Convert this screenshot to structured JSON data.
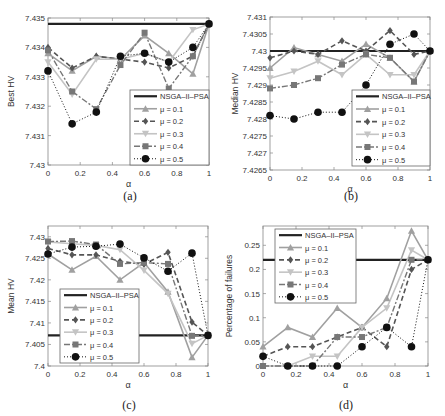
{
  "figure": {
    "captions": [
      "(a)",
      "(b)",
      "(c)",
      "(d)"
    ]
  },
  "styles": {
    "NSGA-II-PSA": {
      "color": "#222222",
      "width": 2.2,
      "dash": "",
      "marker": "none"
    },
    "μ = 0.1": {
      "color": "#a0a0a0",
      "width": 1.6,
      "dash": "",
      "marker": "triangle-up"
    },
    "μ = 0.2": {
      "color": "#555555",
      "width": 1.6,
      "dash": "5,3",
      "marker": "diamond"
    },
    "μ = 0.3": {
      "color": "#c4c4c4",
      "width": 1.6,
      "dash": "",
      "marker": "triangle-down"
    },
    "μ = 0.4": {
      "color": "#777777",
      "width": 1.4,
      "dash": "6,2,2,2",
      "marker": "square"
    },
    "μ = 0.5": {
      "color": "#111111",
      "width": 1.0,
      "dash": "1,2",
      "marker": "circle"
    }
  },
  "chart_data": [
    {
      "id": "a",
      "type": "line",
      "title": "",
      "caption": "(a)",
      "xlabel": "α",
      "ylabel": "Best HV",
      "xlim": [
        0,
        1
      ],
      "ylim": [
        7.43,
        7.435
      ],
      "xticks": [
        0,
        0.2,
        0.4,
        0.6,
        0.8,
        1
      ],
      "xtick_labels": [
        "0",
        "0.2",
        "0.4",
        "0.6",
        "0.8",
        "1"
      ],
      "yticks": [
        7.43,
        7.431,
        7.432,
        7.433,
        7.434,
        7.435
      ],
      "ytick_labels": [
        "7.43",
        "7.431",
        "7.432",
        "7.433",
        "7.434",
        "7.435"
      ],
      "frame": {
        "left": 48,
        "top": 18,
        "right": 209,
        "bottom": 165
      },
      "legend": {
        "x": 130,
        "y": 90,
        "w": 79,
        "h": 75,
        "position": "lower right"
      },
      "x": [
        0,
        0.15,
        0.3,
        0.45,
        0.6,
        0.75,
        0.9,
        1.0
      ],
      "baseline": {
        "name": "NSGA-II-PSA",
        "value": 7.4348
      },
      "series": [
        {
          "name": "μ = 0.1",
          "values": [
            7.4338,
            7.4332,
            7.4337,
            7.4336,
            7.4344,
            7.4338,
            7.4331,
            7.4348
          ]
        },
        {
          "name": "μ = 0.2",
          "values": [
            7.434,
            7.4333,
            7.4337,
            7.4336,
            7.4335,
            7.4333,
            7.4337,
            7.4348
          ]
        },
        {
          "name": "μ = 0.3",
          "values": [
            7.4335,
            7.4324,
            7.4336,
            7.4336,
            7.4338,
            7.4335,
            7.4346,
            7.4348
          ]
        },
        {
          "name": "μ = 0.4",
          "values": [
            7.4339,
            7.4325,
            7.4319,
            7.4334,
            7.4345,
            7.4326,
            7.4337,
            7.4348
          ]
        },
        {
          "name": "μ = 0.5",
          "values": [
            7.4332,
            7.4314,
            7.4318,
            7.4337,
            7.4338,
            7.4335,
            7.434,
            7.4348
          ]
        }
      ]
    },
    {
      "id": "b",
      "type": "line",
      "title": "",
      "caption": "(b)",
      "xlabel": "α",
      "ylabel": "Median HV",
      "xlim": [
        0,
        1
      ],
      "ylim": [
        7.4265,
        7.431
      ],
      "xticks": [
        0,
        0.2,
        0.4,
        0.6,
        0.8,
        1
      ],
      "xtick_labels": [
        "0",
        "0.2",
        "0.4",
        "0.6",
        "0.8",
        "1"
      ],
      "yticks": [
        7.4265,
        7.427,
        7.4275,
        7.428,
        7.4285,
        7.429,
        7.4295,
        7.43,
        7.4305,
        7.431
      ],
      "ytick_labels": [
        "7.4265",
        "7.427",
        "7.4275",
        "7.428",
        "7.4285",
        "7.429",
        "7.4295",
        "7.43",
        "7.4305",
        "7.431"
      ],
      "frame": {
        "left": 270,
        "top": 17,
        "right": 430,
        "bottom": 170
      },
      "legend": {
        "x": 352,
        "y": 90,
        "w": 78,
        "h": 76,
        "position": "lower right"
      },
      "x": [
        0,
        0.15,
        0.3,
        0.45,
        0.6,
        0.75,
        0.9,
        1.0
      ],
      "baseline": {
        "name": "NSGA-II-PSA",
        "value": 7.43
      },
      "series": [
        {
          "name": "μ = 0.1",
          "values": [
            7.4295,
            7.4301,
            7.4299,
            7.4297,
            7.4302,
            7.4298,
            7.4291,
            7.43
          ]
        },
        {
          "name": "μ = 0.2",
          "values": [
            7.4298,
            7.43,
            7.4299,
            7.4303,
            7.43,
            7.4306,
            7.4299,
            7.43
          ]
        },
        {
          "name": "μ = 0.3",
          "values": [
            7.4292,
            7.4294,
            7.4297,
            7.4293,
            7.4299,
            7.4293,
            7.4293,
            7.43
          ]
        },
        {
          "name": "μ = 0.4",
          "values": [
            7.4289,
            7.429,
            7.4292,
            7.4296,
            7.4299,
            7.4298,
            7.4291,
            7.43
          ]
        },
        {
          "name": "μ = 0.5",
          "values": [
            7.4281,
            7.428,
            7.4282,
            7.4282,
            7.429,
            7.4302,
            7.4305,
            7.43
          ]
        }
      ]
    },
    {
      "id": "c",
      "type": "line",
      "title": "",
      "caption": "(c)",
      "xlabel": "α",
      "ylabel": "Mean HV",
      "xlim": [
        0,
        1
      ],
      "ylim": [
        7.4,
        7.4325
      ],
      "xticks": [
        0,
        0.2,
        0.4,
        0.6,
        0.8,
        1
      ],
      "xtick_labels": [
        "0",
        "0.2",
        "0.4",
        "0.6",
        "0.8",
        "1"
      ],
      "yticks": [
        7.4,
        7.405,
        7.41,
        7.415,
        7.42,
        7.425,
        7.43
      ],
      "ytick_labels": [
        "7.4",
        "7.405",
        "7.41",
        "7.415",
        "7.42",
        "7.425",
        "7.43"
      ],
      "frame": {
        "left": 48,
        "top": 226,
        "right": 208,
        "bottom": 366
      },
      "legend": {
        "x": 60,
        "y": 289,
        "w": 79,
        "h": 74,
        "position": "lower left"
      },
      "x": [
        0,
        0.15,
        0.3,
        0.45,
        0.6,
        0.75,
        0.9,
        1.0
      ],
      "baseline": {
        "name": "NSGA-II-PSA",
        "value": 7.4071
      },
      "series": [
        {
          "name": "μ = 0.1",
          "values": [
            7.426,
            7.4223,
            7.4255,
            7.42,
            7.424,
            7.4172,
            7.402,
            7.4071
          ]
        },
        {
          "name": "μ = 0.2",
          "values": [
            7.4273,
            7.4258,
            7.4258,
            7.4243,
            7.4236,
            7.4264,
            7.4102,
            7.4071
          ]
        },
        {
          "name": "μ = 0.3",
          "values": [
            7.4288,
            7.4284,
            7.428,
            7.427,
            7.4222,
            7.4168,
            7.4052,
            7.4071
          ]
        },
        {
          "name": "μ = 0.4",
          "values": [
            7.4289,
            7.429,
            7.4282,
            7.4237,
            7.424,
            7.4237,
            7.407,
            7.4071
          ]
        },
        {
          "name": "μ = 0.5",
          "values": [
            7.426,
            7.4276,
            7.4278,
            7.4283,
            7.4251,
            7.422,
            7.4262,
            7.4071
          ]
        }
      ]
    },
    {
      "id": "d",
      "type": "line",
      "title": "",
      "caption": "(d)",
      "xlabel": "α",
      "ylabel": "Percentage of failures",
      "xlim": [
        0,
        1
      ],
      "ylim": [
        0,
        0.29
      ],
      "xticks": [
        0,
        0.2,
        0.4,
        0.6,
        0.8,
        1
      ],
      "xtick_labels": [
        "0",
        "0.2",
        "0.4",
        "0.6",
        "0.8",
        "1"
      ],
      "yticks": [
        0,
        0.05,
        0.1,
        0.15,
        0.2,
        0.25
      ],
      "ytick_labels": [
        "0",
        "0.05",
        "0.1",
        "0.15",
        "0.2",
        "0.25"
      ],
      "frame": {
        "left": 263,
        "top": 226,
        "right": 428,
        "bottom": 366
      },
      "legend": {
        "x": 275,
        "y": 229,
        "w": 81,
        "h": 74,
        "position": "upper left"
      },
      "x": [
        0,
        0.15,
        0.3,
        0.45,
        0.6,
        0.75,
        0.9,
        1.0
      ],
      "baseline": {
        "name": "NSGA-II-PSA",
        "value": 0.22
      },
      "series": [
        {
          "name": "μ = 0.1",
          "values": [
            0.04,
            0.08,
            0.06,
            0.12,
            0.08,
            0.14,
            0.28,
            0.22
          ]
        },
        {
          "name": "μ = 0.2",
          "values": [
            0.02,
            0.04,
            0.04,
            0.06,
            0.08,
            0.04,
            0.2,
            0.22
          ]
        },
        {
          "name": "μ = 0.3",
          "values": [
            0.0,
            0.0,
            0.02,
            0.02,
            0.08,
            0.12,
            0.24,
            0.22
          ]
        },
        {
          "name": "μ = 0.4",
          "values": [
            0.0,
            0.0,
            0.0,
            0.06,
            0.06,
            0.08,
            0.22,
            0.22
          ]
        },
        {
          "name": "μ = 0.5",
          "values": [
            0.02,
            0.0,
            0.0,
            0.0,
            0.04,
            0.08,
            0.04,
            0.22
          ]
        }
      ]
    }
  ]
}
